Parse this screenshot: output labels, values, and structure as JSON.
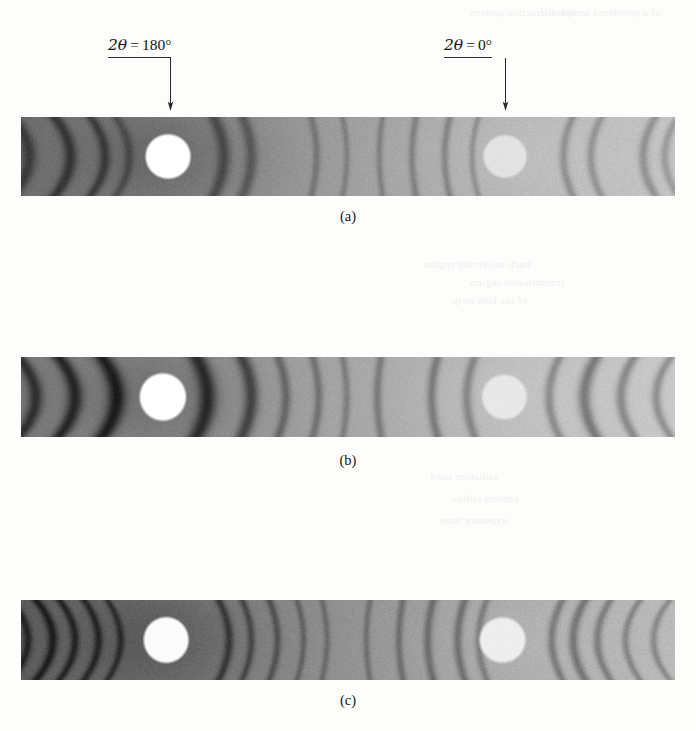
{
  "page": {
    "width": 696,
    "height": 731,
    "background": "#fdfdfc"
  },
  "labels": {
    "left": {
      "text": "2θ = 180°",
      "symbol": "2θ",
      "equals": "=",
      "value": "180°",
      "x": 108,
      "y": 36,
      "arrow_x": 170,
      "arrow_top": 58,
      "arrow_bottom": 112
    },
    "right": {
      "text": "2θ = 0°",
      "symbol": "2θ",
      "equals": "=",
      "value": "0°",
      "x": 444,
      "y": 36,
      "arrow_x": 505,
      "arrow_top": 58,
      "arrow_bottom": 112
    }
  },
  "strips": [
    {
      "id": "strip-a",
      "caption": "(a)",
      "caption_y": 208,
      "x": 21,
      "y": 117,
      "width": 654,
      "height": 79,
      "left_hole": {
        "cx_frac": 0.2245,
        "cy_frac": 0.5,
        "rx_frac": 0.0345,
        "ry_frac": 0.285,
        "color": "#ffffff"
      },
      "right_hole": {
        "cx_frac": 0.7405,
        "cy_frac": 0.5,
        "rx_frac": 0.0335,
        "ry_frac": 0.275,
        "color": "#e3e3e0"
      },
      "base_left": 108,
      "base_right": 196,
      "grain": 11,
      "arcs": [
        {
          "pos": 0.012,
          "width": 0.013,
          "depth": 0.42,
          "curve": 0.95
        },
        {
          "pos": 0.075,
          "width": 0.012,
          "depth": 0.5,
          "curve": 0.85
        },
        {
          "pos": 0.128,
          "width": 0.01,
          "depth": 0.45,
          "curve": 0.78
        },
        {
          "pos": 0.165,
          "width": 0.009,
          "depth": 0.3,
          "curve": 0.7
        },
        {
          "pos": 0.31,
          "width": 0.012,
          "depth": 0.44,
          "curve": 0.55
        },
        {
          "pos": 0.352,
          "width": 0.011,
          "depth": 0.4,
          "curve": 0.48
        },
        {
          "pos": 0.452,
          "width": 0.007,
          "depth": 0.3,
          "curve": 0.3
        },
        {
          "pos": 0.498,
          "width": 0.006,
          "depth": 0.26,
          "curve": 0.22
        },
        {
          "pos": 0.548,
          "width": 0.006,
          "depth": 0.3,
          "curve": 0.18
        },
        {
          "pos": 0.598,
          "width": 0.007,
          "depth": 0.34,
          "curve": 0.22
        },
        {
          "pos": 0.648,
          "width": 0.007,
          "depth": 0.36,
          "curve": 0.28
        },
        {
          "pos": 0.69,
          "width": 0.006,
          "depth": 0.3,
          "curve": 0.34
        },
        {
          "pos": 0.83,
          "width": 0.008,
          "depth": 0.38,
          "curve": 0.5
        },
        {
          "pos": 0.872,
          "width": 0.008,
          "depth": 0.36,
          "curve": 0.56
        },
        {
          "pos": 0.952,
          "width": 0.009,
          "depth": 0.4,
          "curve": 0.66
        },
        {
          "pos": 0.985,
          "width": 0.008,
          "depth": 0.34,
          "curve": 0.72
        }
      ]
    },
    {
      "id": "strip-b",
      "caption": "(b)",
      "caption_y": 452,
      "x": 21,
      "y": 357,
      "width": 654,
      "height": 80,
      "left_hole": {
        "cx_frac": 0.2165,
        "cy_frac": 0.5,
        "rx_frac": 0.0355,
        "ry_frac": 0.3,
        "color": "#ffffff"
      },
      "right_hole": {
        "cx_frac": 0.7395,
        "cy_frac": 0.5,
        "rx_frac": 0.0345,
        "ry_frac": 0.285,
        "color": "#e8e8e5"
      },
      "base_left": 120,
      "base_right": 200,
      "grain": 10,
      "arcs": [
        {
          "pos": 0.022,
          "width": 0.013,
          "depth": 0.62,
          "curve": 0.95
        },
        {
          "pos": 0.082,
          "width": 0.014,
          "depth": 0.72,
          "curve": 0.88
        },
        {
          "pos": 0.146,
          "width": 0.016,
          "depth": 0.78,
          "curve": 0.8
        },
        {
          "pos": 0.285,
          "width": 0.016,
          "depth": 0.76,
          "curve": 0.62
        },
        {
          "pos": 0.352,
          "width": 0.013,
          "depth": 0.66,
          "curve": 0.52
        },
        {
          "pos": 0.405,
          "width": 0.009,
          "depth": 0.44,
          "curve": 0.42
        },
        {
          "pos": 0.455,
          "width": 0.008,
          "depth": 0.4,
          "curve": 0.32
        },
        {
          "pos": 0.498,
          "width": 0.007,
          "depth": 0.34,
          "curve": 0.22
        },
        {
          "pos": 0.545,
          "width": 0.008,
          "depth": 0.4,
          "curve": 0.2
        },
        {
          "pos": 0.628,
          "width": 0.009,
          "depth": 0.48,
          "curve": 0.32
        },
        {
          "pos": 0.682,
          "width": 0.009,
          "depth": 0.44,
          "curve": 0.42
        },
        {
          "pos": 0.808,
          "width": 0.009,
          "depth": 0.46,
          "curve": 0.56
        },
        {
          "pos": 0.862,
          "width": 0.012,
          "depth": 0.62,
          "curve": 0.64
        },
        {
          "pos": 0.918,
          "width": 0.01,
          "depth": 0.5,
          "curve": 0.72
        },
        {
          "pos": 0.972,
          "width": 0.009,
          "depth": 0.46,
          "curve": 0.8
        }
      ]
    },
    {
      "id": "strip-c",
      "caption": "(c)",
      "caption_y": 692,
      "x": 21,
      "y": 600,
      "width": 654,
      "height": 80,
      "left_hole": {
        "cx_frac": 0.2215,
        "cy_frac": 0.5,
        "rx_frac": 0.0345,
        "ry_frac": 0.29,
        "color": "#fbfbf9"
      },
      "right_hole": {
        "cx_frac": 0.7365,
        "cy_frac": 0.5,
        "rx_frac": 0.0355,
        "ry_frac": 0.29,
        "color": "#eeeeea"
      },
      "base_left": 92,
      "base_right": 186,
      "grain": 12,
      "arcs": [
        {
          "pos": 0.01,
          "width": 0.008,
          "depth": 0.48,
          "curve": 0.96
        },
        {
          "pos": 0.048,
          "width": 0.009,
          "depth": 0.56,
          "curve": 0.9
        },
        {
          "pos": 0.082,
          "width": 0.008,
          "depth": 0.52,
          "curve": 0.84
        },
        {
          "pos": 0.118,
          "width": 0.008,
          "depth": 0.5,
          "curve": 0.78
        },
        {
          "pos": 0.152,
          "width": 0.007,
          "depth": 0.44,
          "curve": 0.72
        },
        {
          "pos": 0.318,
          "width": 0.008,
          "depth": 0.5,
          "curve": 0.56
        },
        {
          "pos": 0.352,
          "width": 0.007,
          "depth": 0.44,
          "curve": 0.5
        },
        {
          "pos": 0.392,
          "width": 0.007,
          "depth": 0.42,
          "curve": 0.44
        },
        {
          "pos": 0.432,
          "width": 0.006,
          "depth": 0.34,
          "curve": 0.36
        },
        {
          "pos": 0.468,
          "width": 0.006,
          "depth": 0.3,
          "curve": 0.28
        },
        {
          "pos": 0.528,
          "width": 0.006,
          "depth": 0.32,
          "curve": 0.2
        },
        {
          "pos": 0.578,
          "width": 0.007,
          "depth": 0.38,
          "curve": 0.22
        },
        {
          "pos": 0.622,
          "width": 0.008,
          "depth": 0.44,
          "curve": 0.3
        },
        {
          "pos": 0.668,
          "width": 0.008,
          "depth": 0.46,
          "curve": 0.38
        },
        {
          "pos": 0.7,
          "width": 0.007,
          "depth": 0.38,
          "curve": 0.44
        },
        {
          "pos": 0.812,
          "width": 0.008,
          "depth": 0.46,
          "curve": 0.58
        },
        {
          "pos": 0.845,
          "width": 0.009,
          "depth": 0.52,
          "curve": 0.64
        },
        {
          "pos": 0.882,
          "width": 0.008,
          "depth": 0.46,
          "curve": 0.7
        },
        {
          "pos": 0.925,
          "width": 0.007,
          "depth": 0.42,
          "curve": 0.78
        },
        {
          "pos": 0.968,
          "width": 0.007,
          "depth": 0.4,
          "curve": 0.86
        }
      ]
    }
  ],
  "ghost_text": [
    {
      "text": "the diffraction pattern",
      "x": 470,
      "y": 6,
      "size": 11
    },
    {
      "text": "of a powdered sample",
      "x": 556,
      "y": 6,
      "size": 11
    },
    {
      "text": "back-reflection region",
      "x": 424,
      "y": 258,
      "size": 11
    },
    {
      "text": "transmission region",
      "x": 470,
      "y": 276,
      "size": 11
    },
    {
      "text": "of the film strip",
      "x": 452,
      "y": 294,
      "size": 11
    },
    {
      "text": "radiation used",
      "x": 430,
      "y": 470,
      "size": 11
    },
    {
      "text": "camera radius",
      "x": 452,
      "y": 492,
      "size": 11
    },
    {
      "text": "exposure time",
      "x": 440,
      "y": 514,
      "size": 11
    }
  ]
}
